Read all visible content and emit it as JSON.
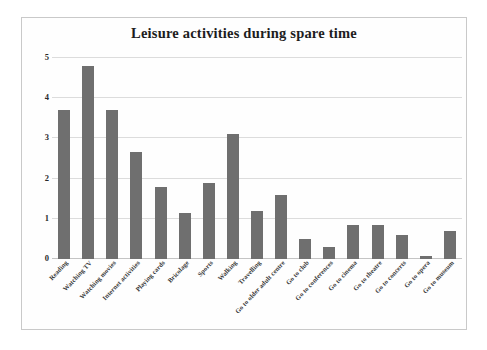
{
  "chart_data": {
    "type": "bar",
    "title": "Leisure activities during spare time",
    "xlabel": "",
    "ylabel": "",
    "ylim": [
      0,
      5
    ],
    "yticks": [
      0,
      1,
      2,
      3,
      4,
      5
    ],
    "grid": true,
    "legend": false,
    "bar_color": "#6f6f6f",
    "categories": [
      "Reading",
      "Watching TV",
      "Watching movies",
      "Internet activities",
      "Playing cards",
      "Bricolage",
      "Sports",
      "Walking",
      "Travelling",
      "Go to older adult centre",
      "Go to club",
      "Go to conferences",
      "Go to cinema",
      "Go to theatre",
      "Go to concerts",
      "Go to opera",
      "Go to museum"
    ],
    "values": [
      3.7,
      4.8,
      3.7,
      2.65,
      1.8,
      1.15,
      1.9,
      3.1,
      1.2,
      1.6,
      0.5,
      0.3,
      0.85,
      0.85,
      0.6,
      0.07,
      0.7
    ]
  }
}
